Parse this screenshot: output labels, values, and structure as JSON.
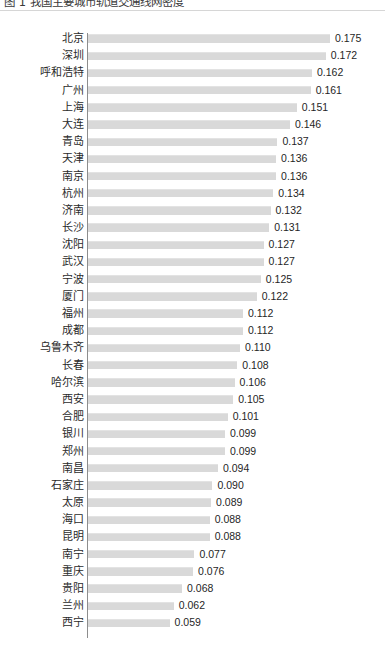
{
  "document": {
    "title_partial": "图 1  我国主要城市轨道交通线网密度"
  },
  "chart_data": {
    "type": "bar",
    "orientation": "horizontal",
    "title": "",
    "xlabel": "",
    "ylabel": "",
    "xlim": [
      0,
      0.175
    ],
    "grid": false,
    "legend": null,
    "bar_color": "#d9d9d9",
    "axis_color": "#8d8d8d",
    "value_format": "0.000",
    "categories": [
      "北京",
      "深圳",
      "呼和浩特",
      "广州",
      "上海",
      "大连",
      "青岛",
      "天津",
      "南京",
      "杭州",
      "济南",
      "长沙",
      "沈阳",
      "武汉",
      "宁波",
      "厦门",
      "福州",
      "成都",
      "乌鲁木齐",
      "长春",
      "哈尔滨",
      "西安",
      "合肥",
      "银川",
      "郑州",
      "南昌",
      "石家庄",
      "太原",
      "海口",
      "昆明",
      "南宁",
      "重庆",
      "贵阳",
      "兰州",
      "西宁"
    ],
    "values": [
      0.175,
      0.172,
      0.162,
      0.161,
      0.151,
      0.146,
      0.137,
      0.136,
      0.136,
      0.134,
      0.132,
      0.131,
      0.127,
      0.127,
      0.125,
      0.122,
      0.112,
      0.112,
      0.11,
      0.108,
      0.106,
      0.105,
      0.101,
      0.099,
      0.099,
      0.094,
      0.09,
      0.089,
      0.088,
      0.088,
      0.077,
      0.076,
      0.068,
      0.062,
      0.059
    ],
    "labels": [
      "0.175",
      "0.172",
      "0.162",
      "0.161",
      "0.151",
      "0.146",
      "0.137",
      "0.136",
      "0.136",
      "0.134",
      "0.132",
      "0.131",
      "0.127",
      "0.127",
      "0.125",
      "0.122",
      "0.112",
      "0.112",
      "0.110",
      "0.108",
      "0.106",
      "0.105",
      "0.101",
      "0.099",
      "0.099",
      "0.094",
      "0.090",
      "0.089",
      "0.088",
      "0.088",
      "0.077",
      "0.076",
      "0.068",
      "0.062",
      "0.059"
    ]
  }
}
